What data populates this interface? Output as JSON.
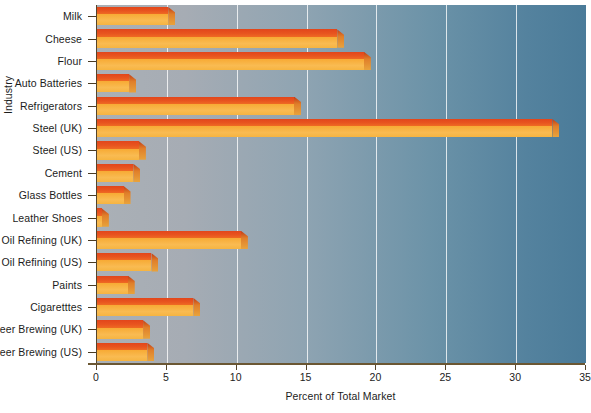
{
  "chart_data": {
    "type": "bar",
    "orientation": "horizontal",
    "title": "",
    "xlabel": "Percent of Total Market",
    "ylabel": "Industry",
    "xlim": [
      0,
      35
    ],
    "xticks": [
      0,
      5,
      10,
      15,
      20,
      25,
      30,
      35
    ],
    "xtick_labels": [
      "0",
      "5",
      "10",
      "15",
      "20",
      "25",
      "30",
      "35"
    ],
    "grid": true,
    "grid_axis": "x",
    "legend": false,
    "categories": [
      "Milk",
      "Cheese",
      "Flour",
      "Auto Batteries",
      "Refrigerators",
      "Steel  (UK)",
      "Steel (US)",
      "Cement",
      "Glass Bottles",
      "Leather Shoes",
      "Oil Refining (UK)",
      "Oil Refining (US)",
      "Paints",
      "Cigaretttes",
      "Beer Brewing (UK)",
      "Beer Brewing (US)"
    ],
    "values": [
      5.1,
      17.2,
      19.1,
      2.3,
      14.1,
      32.6,
      3.0,
      2.6,
      1.9,
      0.35,
      10.3,
      3.9,
      2.2,
      6.9,
      3.3,
      3.6
    ],
    "bar_top_color": "#e8501e",
    "bar_front_color": "#f7b23f",
    "plot_bg_left_color": "#aab0b6",
    "plot_bg_right_color": "#4a7b99",
    "gridline_color": "#ffffff",
    "axis_color": "#55442a"
  }
}
